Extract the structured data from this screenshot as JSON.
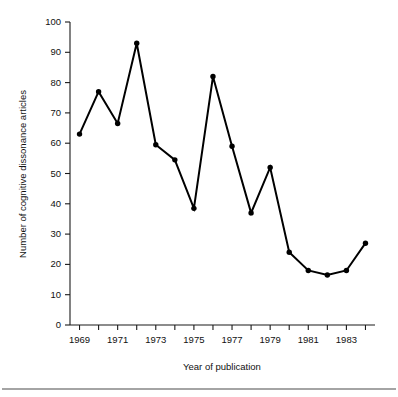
{
  "chart_data": {
    "type": "line",
    "title": "",
    "xlabel": "Year of publication",
    "ylabel": "Number of cognitive dissonance articles",
    "x": [
      1969,
      1970,
      1971,
      1972,
      1973,
      1974,
      1975,
      1976,
      1977,
      1978,
      1979,
      1980,
      1981,
      1982,
      1983,
      1984
    ],
    "values": [
      63,
      77,
      66.5,
      93,
      59.5,
      54.5,
      38.5,
      82,
      59,
      37,
      52,
      24,
      18,
      16.5,
      18,
      27
    ],
    "series": [
      {
        "name": "Number of cognitive dissonance articles",
        "values": [
          63,
          77,
          66.5,
          93,
          59.5,
          54.5,
          38.5,
          82,
          59,
          37,
          52,
          24,
          18,
          16.5,
          18,
          27
        ]
      }
    ],
    "xlim": [
      1968.5,
      1984.5
    ],
    "ylim": [
      0,
      100
    ],
    "yticks": [
      0,
      10,
      20,
      30,
      40,
      50,
      60,
      70,
      80,
      90,
      100
    ],
    "ytick_labels": [
      "0",
      "10",
      "20",
      "30",
      "40",
      "50",
      "60",
      "70",
      "80",
      "90",
      "100"
    ],
    "xticks": [
      1969,
      1970,
      1971,
      1972,
      1973,
      1974,
      1975,
      1976,
      1977,
      1978,
      1979,
      1980,
      1981,
      1982,
      1983,
      1984
    ],
    "xtick_labels": [
      "1969",
      "",
      "1971",
      "",
      "1973",
      "",
      "1975",
      "",
      "1977",
      "",
      "1979",
      "",
      "1981",
      "",
      "1983",
      ""
    ],
    "grid": false,
    "legend": false,
    "legend_position": "none",
    "marker": "filled-circle",
    "line_color": "#000000",
    "marker_color": "#000000",
    "background_color": "#ffffff"
  },
  "figure": {
    "axis_color": "#1a1a1a",
    "rule_color": "#4a4a4a"
  }
}
